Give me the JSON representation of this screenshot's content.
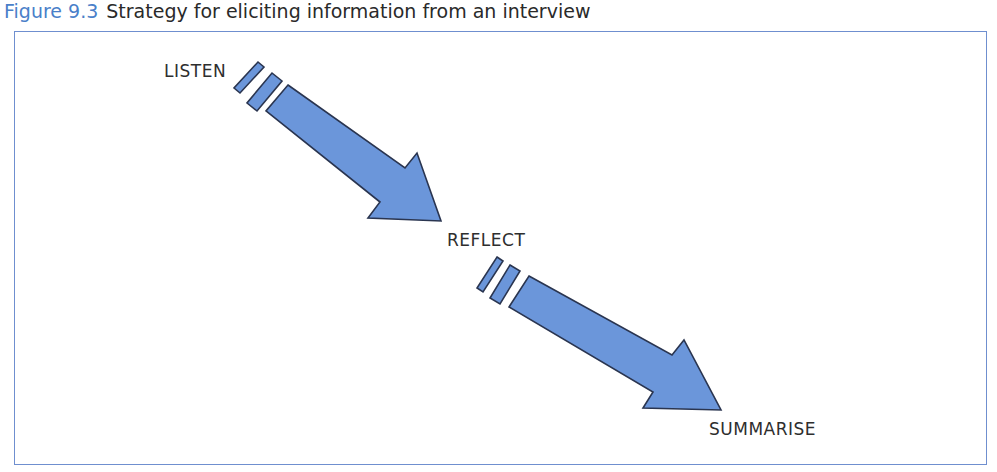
{
  "figure": {
    "number": "Figure 9.3",
    "title": "Strategy for eliciting information from an interview"
  },
  "colors": {
    "arrow_fill": "#6b96da",
    "arrow_stroke": "#2a3550",
    "frame_border": "#6f8fcf",
    "caption_accent": "#4a7fc9"
  },
  "steps": [
    {
      "label": "LISTEN"
    },
    {
      "label": "REFLECT"
    },
    {
      "label": "SUMMARISE"
    }
  ]
}
